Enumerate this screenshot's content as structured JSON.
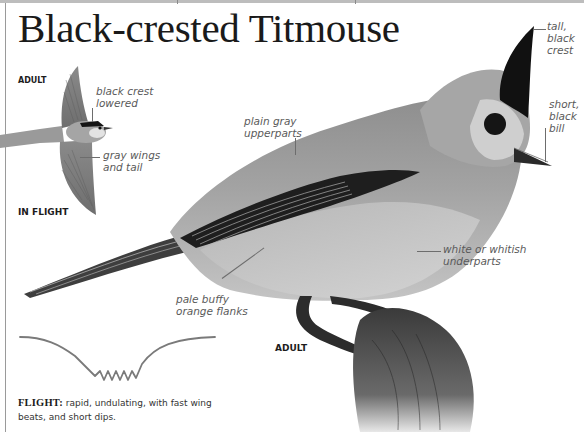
{
  "page": {
    "title": "Black-crested Titmouse"
  },
  "flight_illustration": {
    "age_label": "ADULT",
    "pose_label": "IN FLIGHT",
    "callouts": [
      {
        "id": "crest-lowered",
        "text": "black crest\nlowered"
      },
      {
        "id": "wings-tail",
        "text": "gray wings\nand tail"
      }
    ]
  },
  "main_photo": {
    "age_label": "ADULT",
    "callouts": [
      {
        "id": "crest",
        "text": "tall,\nblack\ncrest"
      },
      {
        "id": "bill",
        "text": "short,\nblack\nbill"
      },
      {
        "id": "upperparts",
        "text": "plain gray\nupperparts"
      },
      {
        "id": "underparts",
        "text": "white or whitish\nunderparts"
      },
      {
        "id": "flanks",
        "text": "pale buffy\norange flanks"
      }
    ]
  },
  "flight_pattern": {
    "keyword": "FLIGHT:",
    "description": " rapid, undulating, with fast wing beats, and short dips."
  },
  "colors": {
    "title": "#1a1a1a",
    "callout_text": "#5a5a5a",
    "leader_line": "#6d6d6d",
    "bird_gray": "#9a9a9a",
    "crest_black": "#111111",
    "flight_path": "#7a7a7a"
  }
}
